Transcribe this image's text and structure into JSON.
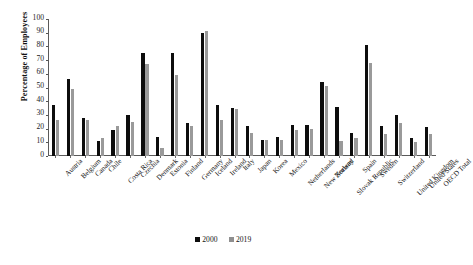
{
  "chart_data": {
    "type": "bar",
    "title": "",
    "xlabel": "",
    "ylabel": "Percentage of Employees",
    "ylim": [
      0,
      100
    ],
    "ytick_step": 10,
    "yticks": [
      0,
      10,
      20,
      30,
      40,
      50,
      60,
      70,
      80,
      90,
      100
    ],
    "grid": false,
    "legend_position": "bottom-center",
    "categories": [
      "Austria",
      "Belgium",
      "Canada",
      "Chile",
      "Costa Rica",
      "Czechia",
      "Denmark",
      "Estonia",
      "Finland",
      "Germany",
      "Iceland",
      "Ireland",
      "Italy",
      "Japan",
      "Korea",
      "Mexico",
      "Netherlands",
      "New Zealand",
      "Norway",
      "Slovak Republic",
      "Spain",
      "Sweden",
      "Switzerland",
      "United Kingdom",
      "United States",
      "OECD Total"
    ],
    "series": [
      {
        "name": "2000",
        "color": "#0d0d0d",
        "values": [
          37,
          56,
          28,
          11,
          19,
          30,
          75,
          14,
          75,
          24,
          90,
          37,
          35,
          22,
          12,
          14,
          23,
          23,
          54,
          36,
          17,
          81,
          22,
          30,
          13,
          21
        ]
      },
      {
        "name": "2019",
        "color": "#9a9a9a",
        "values": [
          26,
          49,
          26,
          13,
          22,
          25,
          67,
          6,
          59,
          22,
          91,
          26,
          34,
          17,
          12,
          12,
          19,
          20,
          51,
          11,
          13,
          68,
          16,
          24,
          10,
          16
        ]
      }
    ]
  },
  "legend": {
    "items": [
      {
        "label": "2000"
      },
      {
        "label": "2019"
      }
    ]
  }
}
